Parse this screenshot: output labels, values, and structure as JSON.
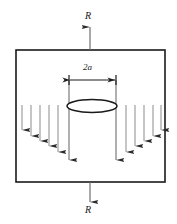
{
  "figure": {
    "type": "mechanics-diagram",
    "labels": {
      "load_top": "R",
      "load_bottom": "R",
      "crack_width": "2a"
    },
    "colors": {
      "plate_outline": "#1a1a1a",
      "crack_outline": "#1a1a1a",
      "arrow_shaft": "#9a9a9a",
      "arrow_head": "#2b2b2b",
      "dimension_line": "#1a1a1a",
      "background": "#ffffff"
    },
    "plate": {
      "x": 16,
      "y": 50,
      "width": 149,
      "height": 132
    },
    "crack_ellipse": {
      "cx": 92,
      "cy": 106,
      "rx": 25,
      "ry": 6.5
    },
    "dimension": {
      "y": 80,
      "x_left": 69,
      "x_right": 116,
      "extension_bottom": 160
    },
    "load_arrows": [
      {
        "name": "top-load-arrow",
        "x": 90,
        "y_start": 50,
        "y_end": 27,
        "direction": "up"
      },
      {
        "name": "bottom-load-arrow",
        "x": 90,
        "y_start": 182,
        "y_end": 202,
        "direction": "down"
      }
    ],
    "traction_arrows": {
      "direction": "down",
      "y_start": 105,
      "left": [
        {
          "x": 22,
          "y_end": 130
        },
        {
          "x": 31,
          "y_end": 136
        },
        {
          "x": 40,
          "y_end": 141
        },
        {
          "x": 49,
          "y_end": 146
        },
        {
          "x": 58,
          "y_end": 152
        }
      ],
      "right": [
        {
          "x": 126,
          "y_end": 152
        },
        {
          "x": 135,
          "y_end": 146
        },
        {
          "x": 144,
          "y_end": 141
        },
        {
          "x": 153,
          "y_end": 136
        },
        {
          "x": 161,
          "y_end": 130
        }
      ],
      "center": [
        {
          "x": 69,
          "y_end": 160
        },
        {
          "x": 116,
          "y_end": 160
        }
      ]
    }
  }
}
